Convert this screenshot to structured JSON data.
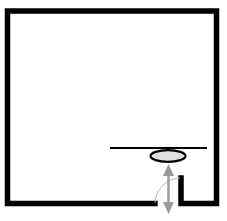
{
  "diagram": {
    "type": "floor-plan",
    "room": {
      "label": "",
      "shape": "rectangle"
    },
    "colors": {
      "wall": "#000000",
      "background": "#ffffff",
      "sink_fill": "#e0e0e0",
      "arrow": "#9a9a9a",
      "door_arc": "#b5b5b5"
    },
    "elements": [
      {
        "name": "outer-wall",
        "kind": "wall"
      },
      {
        "name": "counter",
        "kind": "line"
      },
      {
        "name": "sink",
        "kind": "ellipse"
      },
      {
        "name": "door-opening",
        "kind": "door"
      },
      {
        "name": "door-swing-arc",
        "kind": "arc"
      },
      {
        "name": "access-arrow",
        "kind": "double-arrow"
      }
    ]
  }
}
